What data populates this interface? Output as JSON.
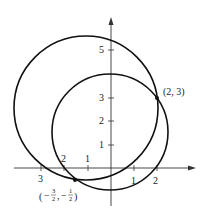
{
  "diagram": {
    "type": "circles-on-coordinate-plane",
    "axes": {
      "x_ticks_positive": [
        "1",
        "2"
      ],
      "x_ticks_negative": [
        "1",
        "2",
        "3"
      ],
      "y_ticks": [
        "1",
        "2",
        "3",
        "5"
      ]
    },
    "circles": [
      {
        "name": "large-circle",
        "center": [
          -1,
          2.5
        ],
        "radius_units": 3.1
      },
      {
        "name": "small-circle",
        "center": [
          0,
          1.5
        ],
        "radius_units": 2.5
      }
    ],
    "points": [
      {
        "name": "intersection-upper",
        "label": "(2, 3)",
        "x": 2,
        "y": 3
      },
      {
        "name": "intersection-lower",
        "label_num1": "3",
        "label_den1": "2",
        "label_num2": "1",
        "label_den2": "2",
        "x": -1.5,
        "y": -0.5
      }
    ]
  }
}
